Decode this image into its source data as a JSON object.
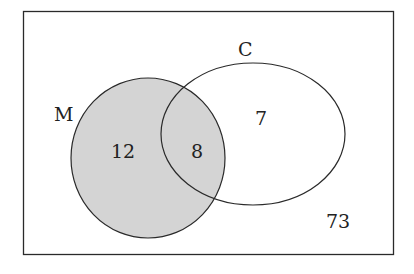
{
  "diagram": {
    "type": "venn",
    "universe": {
      "label": "",
      "outside_value": "73"
    },
    "sets": [
      {
        "name": "M",
        "only_value": "12",
        "shaded": true
      },
      {
        "name": "C",
        "only_value": "7",
        "shaded": false
      }
    ],
    "intersection": {
      "sets": [
        "M",
        "C"
      ],
      "value": "8",
      "shaded": true
    },
    "colors": {
      "shade": "#d4d4d4",
      "stroke": "#2a2a2a",
      "background": "#ffffff"
    }
  },
  "labels": {
    "set_m": "M",
    "set_c": "C",
    "m_only": "12",
    "intersection": "8",
    "c_only": "7",
    "outside": "73"
  }
}
